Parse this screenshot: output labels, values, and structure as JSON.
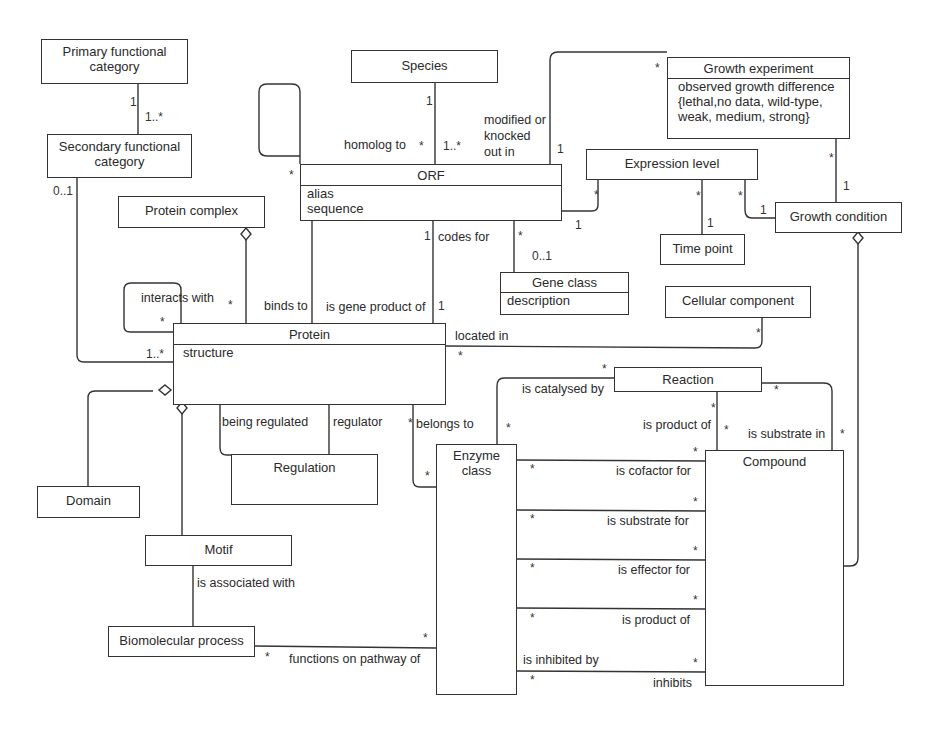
{
  "diagram": {
    "type": "UML class diagram",
    "classes": {
      "primary_functional_category": {
        "name": "Primary functional\ncategory"
      },
      "secondary_functional_category": {
        "name": "Secondary functional\ncategory"
      },
      "species": {
        "name": "Species"
      },
      "orf": {
        "name": "ORF",
        "attributes": [
          "alias",
          "sequence"
        ]
      },
      "growth_experiment": {
        "name": "Growth experiment",
        "attributes": [
          "observed growth difference",
          "{lethal,no data, wild-type,",
          "weak, medium, strong}"
        ]
      },
      "expression_level": {
        "name": "Expression level"
      },
      "time_point": {
        "name": "Time point"
      },
      "growth_condition": {
        "name": "Growth condition"
      },
      "protein_complex": {
        "name": "Protein complex"
      },
      "gene_class": {
        "name": "Gene class",
        "attributes": [
          "description"
        ]
      },
      "cellular_component": {
        "name": "Cellular component"
      },
      "protein": {
        "name": "Protein",
        "attributes": [
          "structure"
        ]
      },
      "reaction": {
        "name": "Reaction"
      },
      "regulation": {
        "name": "Regulation"
      },
      "domain": {
        "name": "Domain"
      },
      "enzyme_class": {
        "name": "Enzyme\nclass"
      },
      "compound": {
        "name": "Compound"
      },
      "motif": {
        "name": "Motif"
      },
      "biomolecular_process": {
        "name": "Biomolecular process"
      }
    },
    "associations": {
      "homolog_to": "homolog to",
      "modified_or_knocked_out_in": "modified or\nknocked\nout in",
      "codes_for": "codes for",
      "interacts_with": "interacts with",
      "binds_to": "binds to",
      "is_gene_product_of": "is gene product of",
      "located_in": "located in",
      "is_catalysed_by": "is catalysed by",
      "is_product_of_reaction": "is product of",
      "is_substrate_in": "is substrate in",
      "being_regulated": "being regulated",
      "regulator": "regulator",
      "belongs_to": "belongs to",
      "is_cofactor_for": "is cofactor for",
      "is_substrate_for": "is substrate for",
      "is_effector_for": "is effector for",
      "is_product_of": "is product of",
      "is_inhibited_by": "is inhibited by",
      "inhibits": "inhibits",
      "is_associated_with": "is associated with",
      "functions_on_pathway_of": "functions on pathway of"
    },
    "multiplicities": {
      "one": "1",
      "one_many": "1..*",
      "zero_one": "0..1",
      "many": "*"
    }
  }
}
